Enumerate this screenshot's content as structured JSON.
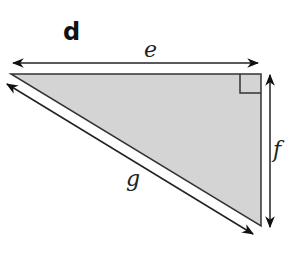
{
  "diagram": {
    "panel_label": "d",
    "shape": "right triangle",
    "fill_color": "#d4d4d4",
    "stroke_color": "#333333",
    "sides": {
      "top": "e",
      "right": "f",
      "hypotenuse": "g"
    },
    "right_angle_marker": "top-right"
  }
}
